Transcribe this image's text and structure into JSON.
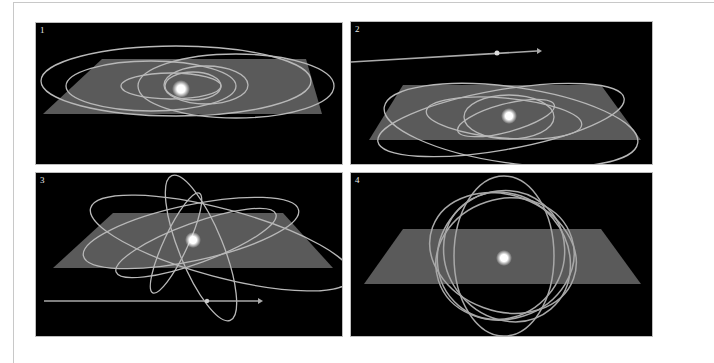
{
  "figure": {
    "colors": {
      "background": "#000000",
      "plane": "#5a5a5a",
      "orbit": "#b4b4b4",
      "star": "#ffffff"
    },
    "panels": [
      {
        "label": "1",
        "content": "orbits nearly coplanar with the plane, elongated ellipses"
      },
      {
        "label": "2",
        "content": "moderately inclined orbits with a passing body trajectory arrow at top"
      },
      {
        "label": "3",
        "content": "strongly inclined tilted orbits with a passing body trajectory arrow at bottom"
      },
      {
        "label": "4",
        "content": "near-polar orbits forming a spherical cage around the star"
      }
    ]
  }
}
